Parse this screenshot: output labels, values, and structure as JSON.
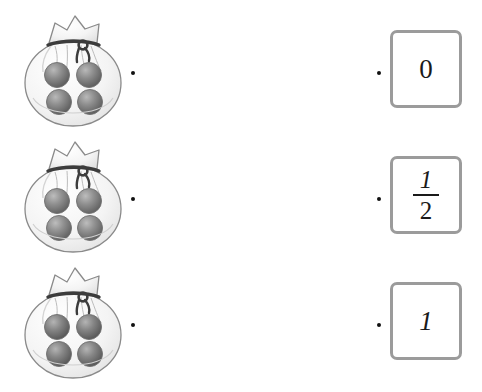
{
  "worksheet": {
    "title": "Marble bag probability matching",
    "background_color": "#ffffff"
  },
  "style": {
    "box_border_color": "#9b9b9b",
    "dot_color": "#111111",
    "marble_color": "#7d7d7d",
    "bag_fill_color": "#f2f2f2",
    "bag_outline_color": "#8a8a8a",
    "knot_color": "#3c3c3c",
    "text_color": "#1a1a1a"
  },
  "rows": [
    {
      "id": "row-1",
      "bag": {
        "name": "bag-four-dark-marbles",
        "marble_count": 4,
        "marbles": [
          "dark",
          "dark",
          "dark",
          "dark"
        ]
      },
      "left_dot_label": "connector-dot",
      "right_dot_label": "connector-dot",
      "answer": {
        "kind": "integer",
        "value": "0"
      }
    },
    {
      "id": "row-2",
      "bag": {
        "name": "bag-four-marbles-mixed",
        "marble_count": 4,
        "marbles": [
          "dark",
          "dark",
          "dark",
          "dark"
        ]
      },
      "left_dot_label": "connector-dot",
      "right_dot_label": "connector-dot",
      "answer": {
        "kind": "fraction",
        "numerator": "1",
        "denominator": "2"
      }
    },
    {
      "id": "row-3",
      "bag": {
        "name": "bag-four-dark-marbles",
        "marble_count": 4,
        "marbles": [
          "dark",
          "dark",
          "dark",
          "dark"
        ]
      },
      "left_dot_label": "connector-dot",
      "right_dot_label": "connector-dot",
      "answer": {
        "kind": "integer",
        "value": "1"
      }
    }
  ]
}
